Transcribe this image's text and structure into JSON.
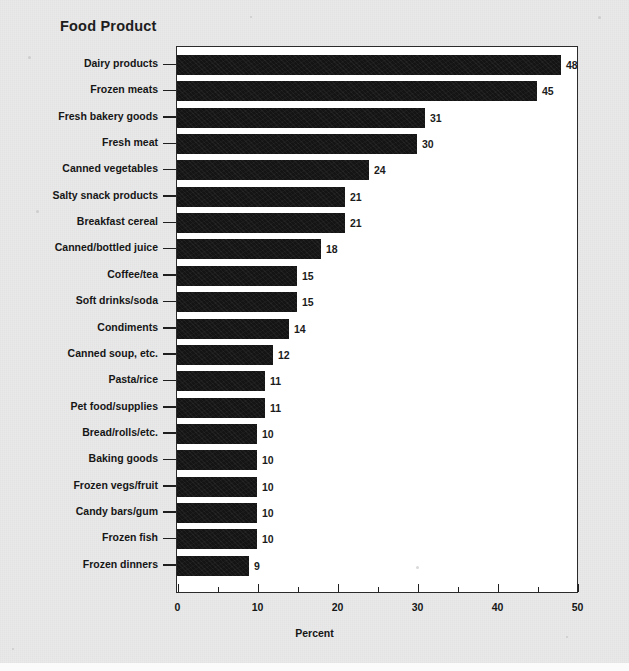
{
  "chart_data": {
    "type": "bar",
    "orientation": "horizontal",
    "title": "Food Product",
    "xlabel": "Percent",
    "ylabel": "",
    "xlim": [
      0,
      50
    ],
    "xticks": [
      0,
      10,
      20,
      30,
      40,
      50
    ],
    "xtick_labels": [
      "0",
      "10",
      "20",
      "30",
      "40",
      "50"
    ],
    "xminor_step": 5,
    "grid": false,
    "legend": false,
    "value_labels": true,
    "bar_color": "#141414",
    "categories": [
      "Dairy products",
      "Frozen meats",
      "Fresh bakery goods",
      "Fresh meat",
      "Canned vegetables",
      "Salty snack products",
      "Breakfast cereal",
      "Canned/bottled juice",
      "Coffee/tea",
      "Soft drinks/soda",
      "Condiments",
      "Canned soup, etc.",
      "Pasta/rice",
      "Pet food/supplies",
      "Bread/rolls/etc.",
      "Baking goods",
      "Frozen vegs/fruit",
      "Candy bars/gum",
      "Frozen fish",
      "Frozen dinners"
    ],
    "values": [
      48,
      45,
      31,
      30,
      24,
      21,
      21,
      18,
      15,
      15,
      14,
      12,
      11,
      11,
      10,
      10,
      10,
      10,
      10,
      9
    ]
  },
  "figure": {
    "background_color": "#e9e9e9",
    "plot_background_color": "#ffffff",
    "frame_color": "#2b2b2b"
  }
}
